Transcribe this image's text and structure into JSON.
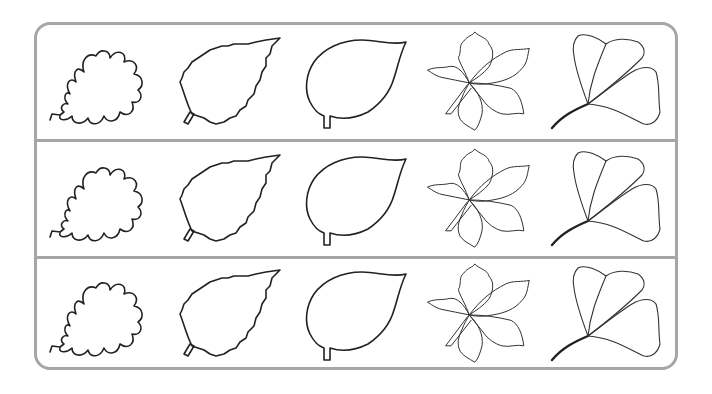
{
  "worksheet": {
    "frame_color": "#a6a6a6",
    "rows": [
      {
        "leaves": [
          "oak-leaf",
          "birch-leaf",
          "linden-leaf",
          "chestnut-leaf",
          "ginkgo-leaf"
        ]
      },
      {
        "leaves": [
          "oak-leaf",
          "birch-leaf",
          "linden-leaf",
          "chestnut-leaf",
          "ginkgo-leaf"
        ]
      },
      {
        "leaves": [
          "oak-leaf",
          "birch-leaf",
          "linden-leaf",
          "chestnut-leaf",
          "ginkgo-leaf"
        ]
      }
    ]
  }
}
